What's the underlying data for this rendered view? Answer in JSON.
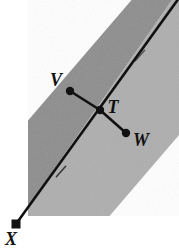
{
  "figure": {
    "canvas": {
      "width": 179,
      "height": 249,
      "background": "#ffffff"
    },
    "colors": {
      "band_dark": "#8d8d8d",
      "band_light": "#a9a9a9",
      "band_edge_light": "#b4b4b4",
      "line": "#111111",
      "label": "#111111",
      "background": "#ffffff"
    },
    "labels": {
      "v": "V",
      "t": "T",
      "w": "W",
      "x": "X"
    },
    "points": [
      {
        "id": "v",
        "label": "V",
        "x": 70,
        "y": 91
      },
      {
        "id": "t",
        "label": "T",
        "x": 100,
        "y": 110
      },
      {
        "id": "w",
        "label": "W",
        "x": 126,
        "y": 133
      },
      {
        "id": "x",
        "label": "X",
        "x": 16,
        "y": 224
      }
    ],
    "segments": [
      {
        "id": "transversal",
        "from": "x",
        "to": "top-right-corner",
        "tick_marks": 2
      },
      {
        "id": "vt",
        "from": "v",
        "to": "t",
        "tick_marks": 0
      },
      {
        "id": "tw",
        "from": "t",
        "to": "w",
        "tick_marks": 0
      }
    ],
    "band": {
      "shape": "rounded-end-strip",
      "orientation_degrees": 50,
      "regions": [
        "dark-left-of-transversal",
        "light-right-of-transversal"
      ]
    }
  }
}
